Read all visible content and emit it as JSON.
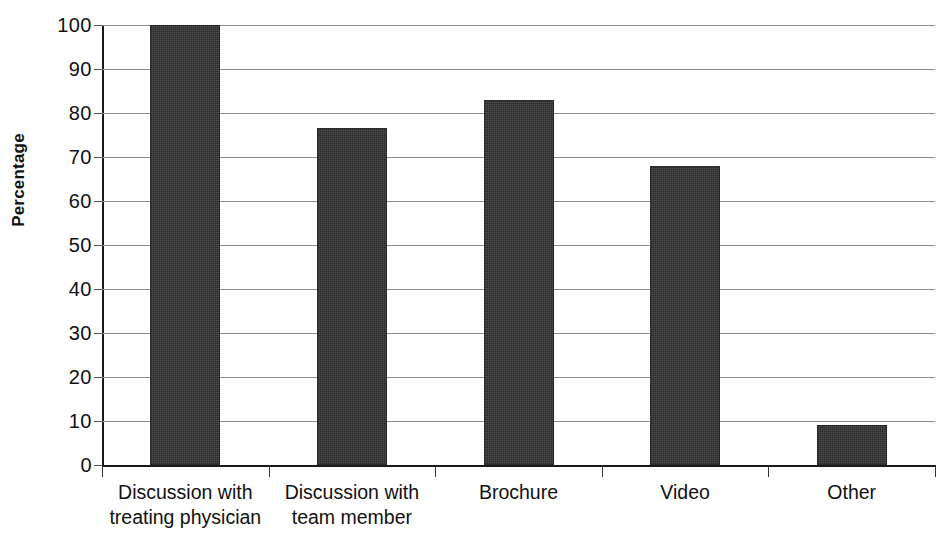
{
  "caption_remnant": "....",
  "chart_data": {
    "type": "bar",
    "title": "",
    "xlabel": "",
    "ylabel": "Percentage",
    "categories": [
      "Discussion with treating physician",
      "Discussion with team member",
      "Brochure",
      "Video",
      "Other"
    ],
    "category_lines": [
      [
        "Discussion with",
        "treating physician"
      ],
      [
        "Discussion with",
        "team member"
      ],
      [
        "Brochure"
      ],
      [
        "Video"
      ],
      [
        "Other"
      ]
    ],
    "values": [
      100,
      76.5,
      83,
      68,
      9
    ],
    "ylim": [
      0,
      100
    ],
    "ytick_step": 10,
    "yticks": [
      100,
      90,
      80,
      70,
      60,
      50,
      40,
      30,
      20,
      10,
      0
    ],
    "ytick_labels": [
      "100",
      "90",
      "80",
      "70",
      "60",
      "50",
      "40",
      "30",
      "20",
      "10",
      "0"
    ],
    "grid": true,
    "legend": "none",
    "bar_color": "#333333",
    "gridline_color": "#8d8d8d",
    "axis_color": "#1a1a1a"
  }
}
